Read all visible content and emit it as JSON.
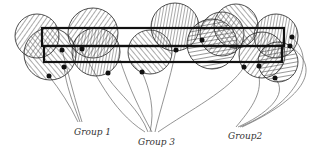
{
  "diagram": {
    "labels": [
      {
        "id": "group1",
        "text": "Group 1",
        "x": 74,
        "y": 127
      },
      {
        "id": "group3",
        "text": "Group 3",
        "x": 138,
        "y": 137
      },
      {
        "id": "group2",
        "text": "Group2",
        "x": 228,
        "y": 131
      }
    ],
    "colors": {
      "stroke": "#111111",
      "hatch": "#555555",
      "string": "#666666",
      "background": "#ffffff"
    }
  }
}
